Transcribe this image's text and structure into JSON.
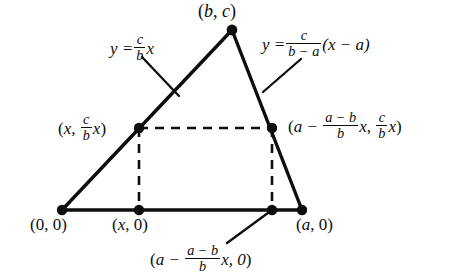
{
  "figure": {
    "background_color": "#ffffff",
    "ink_color": "#0d0d0d"
  },
  "labels": {
    "apex": {
      "name": "apex-vertex-label",
      "text": "(b, c)",
      "parts": [
        "(",
        "b",
        ", ",
        "c",
        ")"
      ]
    },
    "equation_left": {
      "name": "left-side-equation",
      "lhs": "y =",
      "numerator": "c",
      "denominator": "b",
      "trailing": "x"
    },
    "equation_right": {
      "name": "right-side-equation",
      "lhs": "y =",
      "numerator": "c",
      "denominator": "b − a",
      "trailing": "(x − a)"
    },
    "point_left_mid": {
      "name": "left-rectangle-corner-label",
      "open": "(",
      "x_part": "x, ",
      "numerator": "c",
      "denominator": "b",
      "trailing": "x",
      "close": ")"
    },
    "point_right_mid": {
      "name": "right-rectangle-corner-label",
      "open": "(",
      "a_part": "a − ",
      "numerator1": "a − b",
      "denominator1": "b",
      "mid": "x, ",
      "numerator2": "c",
      "denominator2": "b",
      "trailing": "x",
      "close": ")"
    },
    "point_origin": {
      "name": "origin-vertex-label",
      "text": "(0, 0)"
    },
    "point_x0": {
      "name": "x-foot-label",
      "text": "(x, 0)"
    },
    "point_a0": {
      "name": "a-vertex-label",
      "text": "(a, 0)"
    },
    "point_bottom_mid": {
      "name": "right-foot-label",
      "open": "(",
      "a_part": "a − ",
      "numerator": "a − b",
      "denominator": "b",
      "trailing": "x, 0",
      "close": ")"
    }
  },
  "geometry": {
    "vertices": {
      "origin": {
        "x": 62,
        "y": 210
      },
      "apex": {
        "x": 232,
        "y": 30
      },
      "right": {
        "x": 302,
        "y": 210
      }
    },
    "rectangle": {
      "top_left": {
        "x": 139,
        "y": 128
      },
      "top_right": {
        "x": 272,
        "y": 128
      },
      "bottom_left": {
        "x": 139,
        "y": 210
      },
      "bottom_right": {
        "x": 272,
        "y": 210
      }
    },
    "leaders": [
      {
        "name": "left-equation-leader",
        "x1": 142,
        "y1": 57,
        "x2": 179,
        "y2": 96
      },
      {
        "name": "right-equation-leader",
        "x1": 301,
        "y1": 59,
        "x2": 263,
        "y2": 92
      },
      {
        "name": "bottom-label-leader",
        "x1": 272,
        "y1": 210,
        "x2": 227,
        "y2": 243
      }
    ],
    "dot_radius": 5.2,
    "solid_stroke_width": 3.4,
    "dashed_stroke_width": 2.6,
    "dash_pattern": "9 7"
  }
}
